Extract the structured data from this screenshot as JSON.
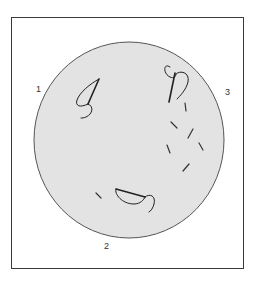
{
  "diagram": {
    "colors": {
      "frame": "#3a3a3a",
      "dish_fill": "#e3e3e3",
      "dish_stroke": "#555555",
      "organism_stroke": "#222222"
    },
    "labels": [
      {
        "id": "1",
        "text": "1"
      },
      {
        "id": "2",
        "text": "2"
      },
      {
        "id": "3",
        "text": "3"
      }
    ],
    "regions": [
      {
        "label": "1",
        "content": "curved organism with flagellum, upper left"
      },
      {
        "label": "2",
        "content": "curved organism with flagellum, bottom center, plus short rod"
      },
      {
        "label": "3",
        "content": "curved organism with flagellum, upper right, plus scattered short rods"
      }
    ]
  }
}
